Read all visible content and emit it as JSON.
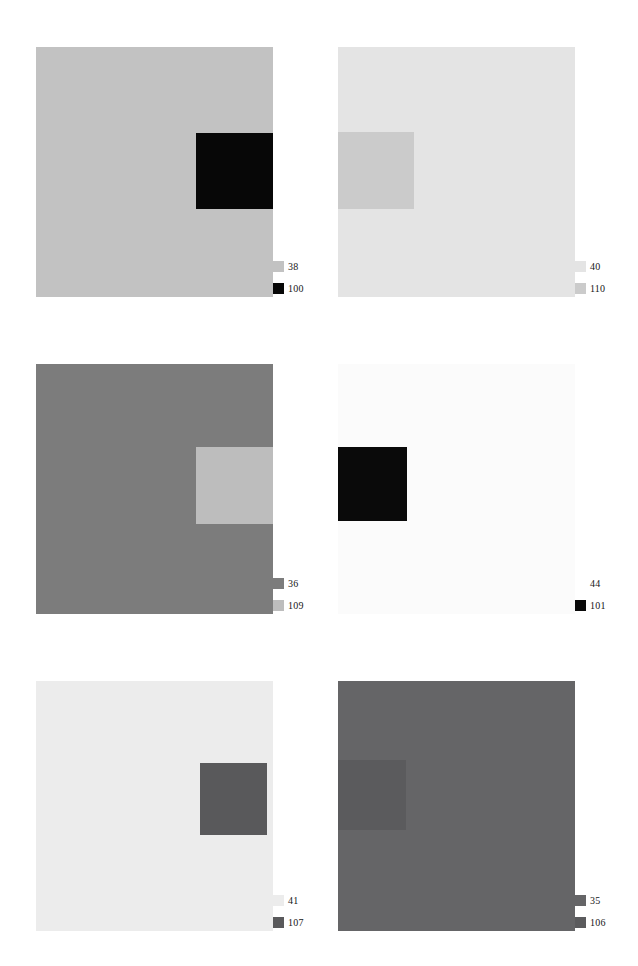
{
  "figure": {
    "type": "gray-patch-contrast-plates",
    "layout": "2 columns x 3 rows",
    "panel_count": 6,
    "background_color": "#ffffff",
    "legend_position": "bottom-right outside each panel",
    "legend_entries_per_panel": 2
  },
  "chart_data": {
    "type": "heatmap",
    "title": "",
    "xlabel": "",
    "ylabel": "",
    "grid": false,
    "legend_position": "bottom-right of each panel",
    "panels": [
      {
        "index": 0,
        "row": 0,
        "col": 0,
        "background_value": "38",
        "background_color": "#c2c2c2",
        "patch_value": "100",
        "patch_color": "#070707",
        "patch_position": "right-upper-middle",
        "patch_rect": {
          "left": 160,
          "top": 86,
          "width": 77,
          "height": 76
        },
        "legend": [
          {
            "label": "38",
            "swatch_color": "#c2c2c2",
            "visible_swatch": true
          },
          {
            "label": "100",
            "swatch_color": "#070707",
            "visible_swatch": true
          }
        ]
      },
      {
        "index": 1,
        "row": 0,
        "col": 1,
        "background_value": "40",
        "background_color": "#e4e4e4",
        "patch_value": "110",
        "patch_color": "#cbcbcb",
        "patch_position": "left-upper-middle",
        "patch_rect": {
          "left": 0,
          "top": 85,
          "width": 76,
          "height": 77
        },
        "legend": [
          {
            "label": "40",
            "swatch_color": "#e4e4e4",
            "visible_swatch": true
          },
          {
            "label": "110",
            "swatch_color": "#cbcbcb",
            "visible_swatch": true
          }
        ]
      },
      {
        "index": 2,
        "row": 1,
        "col": 0,
        "background_value": "36",
        "background_color": "#7c7c7c",
        "patch_value": "109",
        "patch_color": "#bdbdbd",
        "patch_position": "right-middle",
        "patch_rect": {
          "left": 160,
          "top": 83,
          "width": 77,
          "height": 77
        },
        "legend": [
          {
            "label": "36",
            "swatch_color": "#7c7c7c",
            "visible_swatch": true
          },
          {
            "label": "109",
            "swatch_color": "#bdbdbd",
            "visible_swatch": true
          }
        ]
      },
      {
        "index": 3,
        "row": 1,
        "col": 1,
        "background_value": "44",
        "background_color": "#fbfbfb",
        "patch_value": "101",
        "patch_color": "#0a0a0a",
        "patch_position": "left-middle",
        "patch_rect": {
          "left": 0,
          "top": 83,
          "width": 69,
          "height": 74
        },
        "legend": [
          {
            "label": "44",
            "swatch_color": "#fbfbfb",
            "visible_swatch": false
          },
          {
            "label": "101",
            "swatch_color": "#0a0a0a",
            "visible_swatch": true
          }
        ]
      },
      {
        "index": 4,
        "row": 2,
        "col": 0,
        "background_value": "41",
        "background_color": "#ececec",
        "patch_value": "107",
        "patch_color": "#59595b",
        "patch_position": "right-middle",
        "patch_rect": {
          "left": 164,
          "top": 82,
          "width": 67,
          "height": 72
        },
        "legend": [
          {
            "label": "41",
            "swatch_color": "#ececec",
            "visible_swatch": true
          },
          {
            "label": "107",
            "swatch_color": "#59595b",
            "visible_swatch": true
          }
        ]
      },
      {
        "index": 5,
        "row": 2,
        "col": 1,
        "background_value": "35",
        "background_color": "#656567",
        "patch_value": "106",
        "patch_color": "#5b5b5d",
        "patch_position": "left-middle",
        "patch_rect": {
          "left": 0,
          "top": 79,
          "width": 68,
          "height": 70
        },
        "legend": [
          {
            "label": "35",
            "swatch_color": "#656567",
            "visible_swatch": true
          },
          {
            "label": "106",
            "swatch_color": "#5b5b5d",
            "visible_swatch": true
          }
        ]
      }
    ]
  }
}
